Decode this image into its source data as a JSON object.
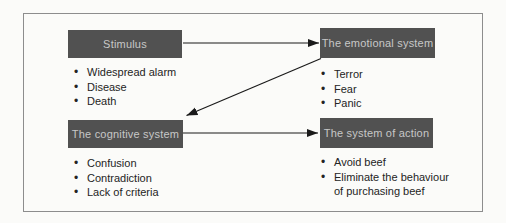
{
  "figure": {
    "background": "#fbfbf9",
    "border_color": "#8d8d8d",
    "box_fill": "#515151",
    "box_text_color": "#c7c7c7",
    "text_color": "#242424",
    "arrow_color": "#1a1a1a"
  },
  "boxes": {
    "stimulus": {
      "label": "Stimulus",
      "bullets": [
        "Widespread alarm",
        "Disease",
        "Death"
      ]
    },
    "emotional": {
      "label": "The emotional system",
      "bullets": [
        "Terror",
        "Fear",
        "Panic"
      ]
    },
    "cognitive": {
      "label": "The cognitive system",
      "bullets": [
        "Confusion",
        "Contradiction",
        "Lack of criteria"
      ]
    },
    "action": {
      "label": "The system of action",
      "bullets": [
        "Avoid beef",
        "Eliminate the behaviour of purchasing beef"
      ]
    }
  },
  "arrows": [
    {
      "from": "stimulus",
      "to": "emotional"
    },
    {
      "from": "emotional",
      "to": "cognitive"
    },
    {
      "from": "cognitive",
      "to": "action"
    }
  ]
}
